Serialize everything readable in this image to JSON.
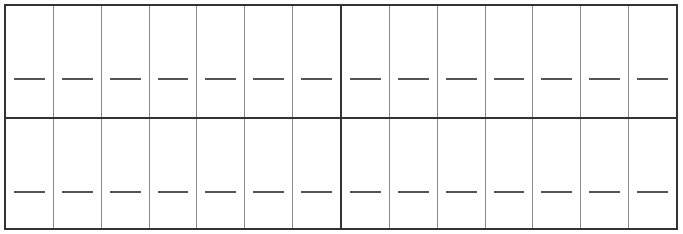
{
  "worksheet": {
    "rows": 2,
    "columns_per_row": 14,
    "group_split_after_column": 7,
    "cells": [
      [
        "",
        "",
        "",
        "",
        "",
        "",
        "",
        "",
        "",
        "",
        "",
        "",
        "",
        ""
      ],
      [
        "",
        "",
        "",
        "",
        "",
        "",
        "",
        "",
        "",
        "",
        "",
        "",
        "",
        ""
      ]
    ],
    "colors": {
      "outer_border": "#333333",
      "inner_line": "#8a8a8a",
      "answer_line": "#555555",
      "background": "#ffffff"
    }
  }
}
